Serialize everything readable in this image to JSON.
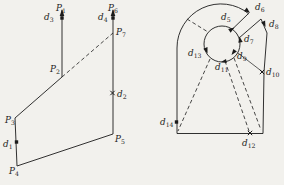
{
  "figure": {
    "background_color": "#f2f1ed",
    "ink_color": "#1b1b1b"
  },
  "left_figure": {
    "description": "two polylines with upward arrows joined by a dashed cut",
    "labels": [
      {
        "id": "P1",
        "main": "P",
        "sub": "1",
        "x": 56,
        "y": 11
      },
      {
        "id": "d3",
        "main": "d",
        "sub": "3",
        "x": 44,
        "y": 20
      },
      {
        "id": "P6",
        "main": "P",
        "sub": "6",
        "x": 108,
        "y": 11
      },
      {
        "id": "d4",
        "main": "d",
        "sub": "4",
        "x": 98,
        "y": 20
      },
      {
        "id": "P7",
        "main": "P",
        "sub": "7",
        "x": 116,
        "y": 35
      },
      {
        "id": "P2",
        "main": "P",
        "sub": "2",
        "x": 50,
        "y": 72
      },
      {
        "id": "d2",
        "main": "d",
        "sub": "2",
        "x": 117,
        "y": 97
      },
      {
        "id": "P3",
        "main": "P",
        "sub": "3",
        "x": 5,
        "y": 123
      },
      {
        "id": "P5",
        "main": "P",
        "sub": "5",
        "x": 115,
        "y": 142
      },
      {
        "id": "d1",
        "main": "d",
        "sub": "1",
        "x": 3,
        "y": 147
      },
      {
        "id": "P4",
        "main": "P",
        "sub": "4",
        "x": 9,
        "y": 174
      }
    ],
    "markers": [
      {
        "id": "d3-point",
        "type": "square",
        "x": 62,
        "y": 18
      },
      {
        "id": "d4-point",
        "type": "square",
        "x": 113,
        "y": 18
      },
      {
        "id": "d1-point",
        "type": "square",
        "x": 16.5,
        "y": 142
      },
      {
        "id": "d2-point",
        "type": "cross",
        "x": 112.5,
        "y": 93
      }
    ]
  },
  "right_figure": {
    "description": "rounded keyhole region with inner circle, slot and dashed cuts",
    "labels": [
      {
        "id": "d5",
        "main": "d",
        "sub": "5",
        "x": 221,
        "y": 20
      },
      {
        "id": "d6",
        "main": "d",
        "sub": "6",
        "x": 255,
        "y": 10
      },
      {
        "id": "d8",
        "main": "d",
        "sub": "8",
        "x": 269,
        "y": 27
      },
      {
        "id": "d7",
        "main": "d",
        "sub": "7",
        "x": 244,
        "y": 42
      },
      {
        "id": "d13",
        "main": "d",
        "sub": "13",
        "x": 188,
        "y": 56
      },
      {
        "id": "d9",
        "main": "d",
        "sub": "9",
        "x": 237,
        "y": 59
      },
      {
        "id": "d11",
        "main": "d",
        "sub": "11",
        "x": 215,
        "y": 70
      },
      {
        "id": "d10",
        "main": "d",
        "sub": "10",
        "x": 266,
        "y": 75
      },
      {
        "id": "d14",
        "main": "d",
        "sub": "14",
        "x": 160,
        "y": 125
      },
      {
        "id": "d12",
        "main": "d",
        "sub": "12",
        "x": 242,
        "y": 146
      }
    ],
    "markers": [
      {
        "id": "d14-point",
        "type": "square",
        "x": 176.5,
        "y": 122
      },
      {
        "id": "d10-point",
        "type": "cross",
        "x": 262,
        "y": 72
      },
      {
        "id": "d12-point",
        "type": "cross",
        "x": 250,
        "y": 133
      }
    ]
  }
}
